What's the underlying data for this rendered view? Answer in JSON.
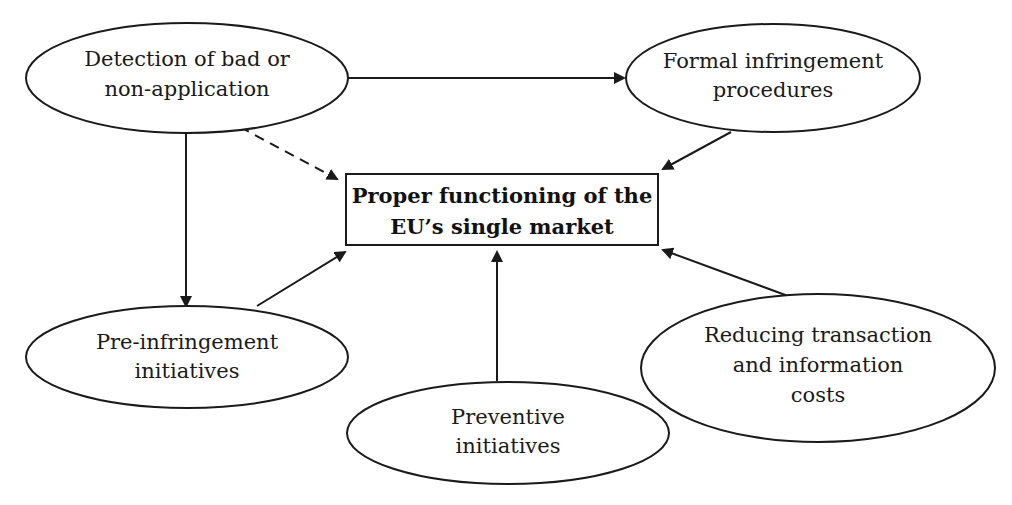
{
  "caption": "Figure: Main objectives of SOLVIT",
  "center_node": {
    "id": "proper-functioning",
    "lines": [
      "Proper functioning of the",
      "EU’s single market"
    ]
  },
  "nodes": [
    {
      "id": "detection",
      "lines": [
        "Detection of bad or",
        "non-application"
      ]
    },
    {
      "id": "formal-infringement",
      "lines": [
        "Formal infringement",
        "procedures"
      ]
    },
    {
      "id": "pre-infringement",
      "lines": [
        "Pre-infringement",
        "initiatives"
      ]
    },
    {
      "id": "preventive",
      "lines": [
        "Preventive",
        "initiatives"
      ]
    },
    {
      "id": "reducing-costs",
      "lines": [
        "Reducing transaction",
        "and information",
        "costs"
      ]
    }
  ],
  "edges": [
    {
      "from": "detection",
      "to": "formal-infringement",
      "style": "solid"
    },
    {
      "from": "detection",
      "to": "pre-infringement",
      "style": "solid"
    },
    {
      "from": "detection",
      "to": "proper-functioning",
      "style": "dashed"
    },
    {
      "from": "formal-infringement",
      "to": "proper-functioning",
      "style": "solid"
    },
    {
      "from": "pre-infringement",
      "to": "proper-functioning",
      "style": "solid"
    },
    {
      "from": "preventive",
      "to": "proper-functioning",
      "style": "solid"
    },
    {
      "from": "reducing-costs",
      "to": "proper-functioning",
      "style": "solid"
    }
  ],
  "colors": {
    "stroke": "#1a1a1a",
    "background": "#ffffff"
  }
}
